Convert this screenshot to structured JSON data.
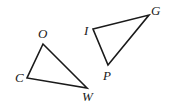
{
  "diagram": {
    "type": "geometry",
    "triangles": [
      {
        "name": "triangle-cow",
        "vertices": [
          {
            "label": "O",
            "x": 43,
            "y": 44,
            "lx": 38,
            "ly": 38
          },
          {
            "label": "C",
            "x": 27,
            "y": 78,
            "lx": 15,
            "ly": 82
          },
          {
            "label": "W",
            "x": 87,
            "y": 88,
            "lx": 82,
            "ly": 101
          }
        ]
      },
      {
        "name": "triangle-igp",
        "vertices": [
          {
            "label": "I",
            "x": 93,
            "y": 29,
            "lx": 83,
            "ly": 35
          },
          {
            "label": "G",
            "x": 149,
            "y": 15,
            "lx": 151,
            "ly": 15
          },
          {
            "label": "P",
            "x": 108,
            "y": 65,
            "lx": 103,
            "ly": 80
          }
        ]
      }
    ]
  }
}
